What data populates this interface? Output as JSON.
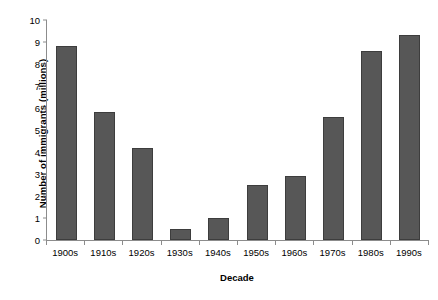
{
  "chart_data": {
    "type": "bar",
    "title": "",
    "subtitle": "",
    "xlabel": "Decade",
    "ylabel": "Number of immigrants (millions)",
    "categories": [
      "1900s",
      "1910s",
      "1920s",
      "1930s",
      "1940s",
      "1950s",
      "1960s",
      "1970s",
      "1980s",
      "1990s"
    ],
    "values": [
      8.8,
      5.8,
      4.2,
      0.5,
      1.0,
      2.5,
      2.9,
      5.6,
      8.6,
      9.3
    ],
    "ylim": [
      0,
      10
    ],
    "yticks": [
      0,
      1,
      2,
      3,
      4,
      5,
      6,
      7,
      8,
      9,
      10
    ],
    "ytick_labels": [
      "0",
      "1",
      "2",
      "3",
      "4",
      "5",
      "6",
      "7",
      "8",
      "9",
      "10"
    ],
    "grid": false,
    "legend": null,
    "legend_position": "none",
    "bar_color": "#575757",
    "bar_edge_color": "#3d3d3d",
    "axis_color": "#8c8c8c",
    "background": "#ffffff"
  }
}
